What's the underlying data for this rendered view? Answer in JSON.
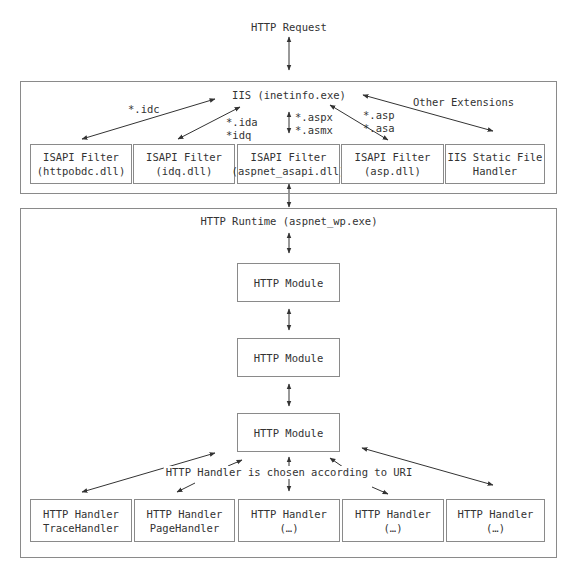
{
  "diagram": {
    "request_label": "HTTP Request",
    "iis": {
      "title": "IIS (inetinfo.exe)",
      "extension_labels": {
        "idc": "*.idc",
        "ida": "*.ida",
        "idq": "*idq",
        "aspx": "*.aspx",
        "asmx": "*.asmx",
        "asp": "*.asp",
        "asa": "*.asa",
        "other": "Other Extensions"
      },
      "filters": [
        {
          "line1": "ISAPI Filter",
          "line2": "(httpobdc.dll)"
        },
        {
          "line1": "ISAPI Filter",
          "line2": "(idq.dll)"
        },
        {
          "line1": "ISAPI Filter",
          "line2": "(aspnet_asapi.dll)"
        },
        {
          "line1": "ISAPI Filter",
          "line2": "(asp.dll)"
        },
        {
          "line1": "IIS Static File",
          "line2": "Handler"
        }
      ]
    },
    "runtime": {
      "title": "HTTP Runtime (aspnet_wp.exe)",
      "modules": [
        "HTTP Module",
        "HTTP Module",
        "HTTP Module"
      ],
      "handler_note": "HTTP Handler is chosen according to URI",
      "handlers": [
        {
          "line1": "HTTP Handler",
          "line2": "TraceHandler"
        },
        {
          "line1": "HTTP Handler",
          "line2": "PageHandler"
        },
        {
          "line1": "HTTP Handler",
          "line2": "(…)"
        },
        {
          "line1": "HTTP Handler",
          "line2": "(…)"
        },
        {
          "line1": "HTTP Handler",
          "line2": "(…)"
        }
      ]
    },
    "colors": {
      "line": "#333333",
      "border": "#8a8a8a",
      "text": "#333333"
    }
  }
}
